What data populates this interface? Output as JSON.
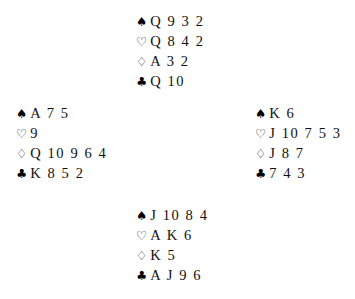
{
  "diagram": {
    "layout": "compass",
    "deal_type": "four-hand bridge deal",
    "suit_order": [
      "spades",
      "hearts",
      "diamonds",
      "clubs"
    ],
    "suit_symbols": {
      "spades": "♠",
      "hearts": "♡",
      "diamonds": "♢",
      "clubs": "♣"
    },
    "suit_symbol_names": {
      "spades": "spade-suit-icon",
      "hearts": "heart-suit-icon",
      "diamonds": "diamond-suit-icon",
      "clubs": "club-suit-icon"
    },
    "ink_color": "#111111",
    "background_color": "#ffffff"
  },
  "hands": {
    "north": {
      "position": "North",
      "spades": "Q 9 3 2",
      "hearts": "Q 8 4 2",
      "diamonds": "A 3 2",
      "clubs": "Q 10"
    },
    "west": {
      "position": "West",
      "spades": "A 7 5",
      "hearts": "9",
      "diamonds": "Q 10 9 6 4",
      "clubs": "K 8 5 2"
    },
    "east": {
      "position": "East",
      "spades": "K 6",
      "hearts": "J 10 7 5 3",
      "diamonds": "J 8 7",
      "clubs": "7 4 3"
    },
    "south": {
      "position": "South",
      "spades": "J 10 8 4",
      "hearts": "A K 6",
      "diamonds": "K 5",
      "clubs": "A J 9 6"
    }
  }
}
